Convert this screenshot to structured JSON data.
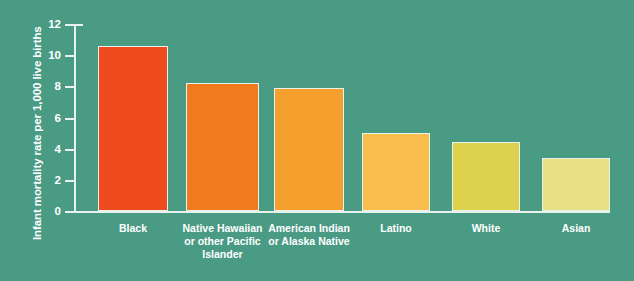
{
  "chart_data": {
    "type": "bar",
    "title": "",
    "xlabel": "",
    "ylabel": "Infant mortality rate per 1,000 live births",
    "ylim": [
      0,
      12
    ],
    "yticks": [
      "0",
      "2",
      "4",
      "6",
      "8",
      "10",
      "12"
    ],
    "grid": false,
    "legend": "none",
    "background_color": "#4a9b84",
    "axis_color": "#e8f3ee",
    "text_color": "#ffffff",
    "categories": [
      "Black",
      "Native Hawaiian or other Pacific Islander",
      "American Indian or Alaska Native",
      "Latino",
      "White",
      "Asian"
    ],
    "values": [
      10.6,
      8.2,
      7.9,
      5.0,
      4.4,
      3.4
    ],
    "bar_colors": [
      "#ee4b1e",
      "#f07b1e",
      "#f5a02e",
      "#f9be4e",
      "#ddd24e",
      "#eae083"
    ],
    "bars": [
      {
        "label": "Black",
        "label_lines": [
          "Black"
        ],
        "value": 10.6,
        "color": "#ee4b1e",
        "x": 24,
        "width": 70
      },
      {
        "label": "Native Hawaiian or other Pacific Islander",
        "label_lines": [
          "Native Hawaiian",
          "or other Pacific",
          "Islander"
        ],
        "value": 8.2,
        "color": "#f07b1e",
        "x": 112,
        "width": 73
      },
      {
        "label": "American Indian or Alaska Native",
        "label_lines": [
          "American Indian",
          "or Alaska Native"
        ],
        "value": 7.9,
        "color": "#f5a02e",
        "x": 200,
        "width": 70
      },
      {
        "label": "Latino",
        "label_lines": [
          "Latino"
        ],
        "value": 5.0,
        "color": "#f9be4e",
        "x": 288,
        "width": 68
      },
      {
        "label": "White",
        "label_lines": [
          "White"
        ],
        "value": 4.4,
        "color": "#ddd24e",
        "x": 378,
        "width": 68
      },
      {
        "label": "Asian",
        "label_lines": [
          "Asian"
        ],
        "value": 3.4,
        "color": "#eae083",
        "x": 468,
        "width": 68
      }
    ]
  }
}
